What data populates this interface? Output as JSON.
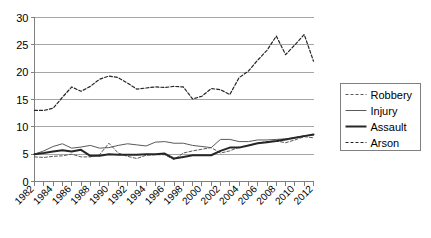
{
  "chart_data": {
    "type": "line",
    "title": "",
    "xlabel": "",
    "ylabel": "",
    "xlim": [
      1982,
      2012
    ],
    "ylim": [
      0,
      30
    ],
    "grid": true,
    "legend_position": "right",
    "x": [
      1982,
      1983,
      1984,
      1985,
      1986,
      1987,
      1988,
      1989,
      1990,
      1991,
      1992,
      1993,
      1994,
      1995,
      1996,
      1997,
      1998,
      1999,
      2000,
      2001,
      2002,
      2003,
      2004,
      2005,
      2006,
      2007,
      2008,
      2009,
      2010,
      2011,
      2012
    ],
    "xticks": [
      1982,
      1983,
      1984,
      1985,
      1986,
      1987,
      1988,
      1989,
      1990,
      1991,
      1992,
      1993,
      1994,
      1995,
      1996,
      1997,
      1998,
      1999,
      2000,
      2001,
      2002,
      2003,
      2004,
      2005,
      2006,
      2007,
      2008,
      2009,
      2010,
      2011,
      2012
    ],
    "xtick_labels": [
      "1982",
      "",
      "1984",
      "",
      "1986",
      "",
      "1988",
      "",
      "1990",
      "",
      "1992",
      "",
      "1994",
      "",
      "1996",
      "",
      "1998",
      "",
      "2000",
      "",
      "2002",
      "",
      "2004",
      "",
      "2006",
      "",
      "2008",
      "",
      "2010",
      "",
      "2012"
    ],
    "yticks": [
      0,
      5,
      10,
      15,
      20,
      25,
      30
    ],
    "ytick_labels": [
      "0",
      "5",
      "10",
      "15",
      "20",
      "25",
      "30"
    ],
    "series": [
      {
        "name": "Robbery",
        "style": "dashed",
        "width": 1.0,
        "color": "#595959",
        "values": [
          4.5,
          4.4,
          4.6,
          4.7,
          5.0,
          4.5,
          4.5,
          4.9,
          7.0,
          5.2,
          4.6,
          4.2,
          4.8,
          4.9,
          4.9,
          4.0,
          5.2,
          5.6,
          5.9,
          6.2,
          5.2,
          5.6,
          6.3,
          6.6,
          7.0,
          7.3,
          7.4,
          7.1,
          7.6,
          8.2,
          8.0
        ]
      },
      {
        "name": "Injury",
        "style": "solid",
        "width": 1.0,
        "color": "#595959",
        "values": [
          5.0,
          5.6,
          6.4,
          6.9,
          6.1,
          6.3,
          6.6,
          6.1,
          6.2,
          6.6,
          6.9,
          6.7,
          6.5,
          7.2,
          7.3,
          7.0,
          7.0,
          6.6,
          6.4,
          6.2,
          7.7,
          7.7,
          7.3,
          7.3,
          7.6,
          7.6,
          7.7,
          7.8,
          8.0,
          8.4,
          8.5
        ]
      },
      {
        "name": "Assault",
        "style": "solid",
        "width": 2.0,
        "color": "#262626",
        "values": [
          5.0,
          5.2,
          5.5,
          5.7,
          5.5,
          5.8,
          4.7,
          4.7,
          5.0,
          4.9,
          4.9,
          4.9,
          5.0,
          5.0,
          5.1,
          4.2,
          4.5,
          4.8,
          4.8,
          4.8,
          5.6,
          6.2,
          6.2,
          6.6,
          7.0,
          7.2,
          7.4,
          7.7,
          8.0,
          8.3,
          8.6
        ]
      },
      {
        "name": "Arson",
        "style": "dashed",
        "width": 1.2,
        "color": "#262626",
        "values": [
          13.0,
          13.0,
          13.4,
          15.4,
          17.3,
          16.5,
          17.4,
          18.7,
          19.3,
          19.0,
          18.0,
          16.9,
          17.1,
          17.3,
          17.2,
          17.4,
          17.3,
          15.1,
          15.6,
          17.0,
          16.8,
          15.9,
          19.0,
          20.2,
          22.2,
          24.0,
          26.6,
          23.2,
          25.0,
          26.9,
          22.0
        ]
      }
    ]
  },
  "legend": {
    "items": [
      {
        "label": "Robbery"
      },
      {
        "label": "Injury"
      },
      {
        "label": "Assault"
      },
      {
        "label": "Arson"
      }
    ]
  }
}
